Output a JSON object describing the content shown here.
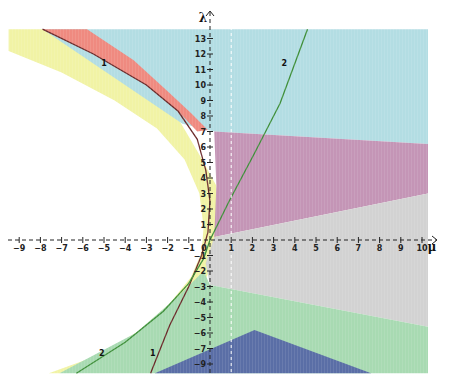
{
  "chart_data": {
    "type": "area",
    "title": "",
    "xlabel": "μ",
    "ylabel": "λ",
    "xlim": [
      -9.5,
      10.3
    ],
    "ylim": [
      -8.5,
      13.8
    ],
    "grid": false,
    "x_ticks": [
      -9,
      -8,
      -7,
      -6,
      -5,
      -4,
      -3,
      -2,
      -1,
      0,
      1,
      2,
      3,
      4,
      5,
      6,
      7,
      8,
      9,
      10
    ],
    "y_ticks": [
      -8,
      -7,
      -6,
      -5,
      -4,
      -3,
      -2,
      -1,
      1,
      2,
      3,
      4,
      5,
      6,
      7,
      8,
      9,
      10,
      11,
      12,
      13
    ],
    "y_tick_labels": [
      "-9",
      "-7",
      "-6",
      "-5",
      "-4",
      "-3",
      "-2",
      "-1",
      "1",
      "2",
      "3",
      "4",
      "5",
      "6",
      "7",
      "8",
      "9",
      "10",
      "11",
      "12",
      "13"
    ],
    "origin_label": "0",
    "dashed_reference_line": {
      "mu": 1
    },
    "regions": [
      {
        "name": "cyan",
        "color": "#b3dde3",
        "polygon": [
          [
            -7.9,
            13.6
          ],
          [
            10.3,
            13.6
          ],
          [
            10.3,
            6.2
          ],
          [
            0.2,
            7.0
          ],
          [
            -1.3,
            7.5
          ]
        ]
      },
      {
        "name": "purple",
        "color": "#c495b6",
        "polygon": [
          [
            0.2,
            7.0
          ],
          [
            10.3,
            6.2
          ],
          [
            10.3,
            3.0
          ],
          [
            0.2,
            0.2
          ],
          [
            0.3,
            3.5
          ]
        ]
      },
      {
        "name": "gray",
        "color": "#d2d2d2",
        "polygon": [
          [
            0.2,
            0.2
          ],
          [
            10.3,
            3.0
          ],
          [
            10.3,
            -5.6
          ],
          [
            0,
            -2.9
          ],
          [
            -0.2,
            -1.5
          ]
        ]
      },
      {
        "name": "green",
        "color": "#a8dab2",
        "polygon": [
          [
            0,
            -2.9
          ],
          [
            10.3,
            -5.6
          ],
          [
            10.3,
            -8.6
          ],
          [
            -7.1,
            -8.6
          ],
          [
            -3.5,
            -6.0
          ],
          [
            -1.4,
            -3.5
          ],
          [
            -0.3,
            -2.0
          ]
        ]
      },
      {
        "name": "blue",
        "color": "#5a6ea6",
        "polygon": [
          [
            -2.6,
            -8.6
          ],
          [
            2.1,
            -5.8
          ],
          [
            7.6,
            -8.6
          ]
        ]
      },
      {
        "name": "red",
        "color": "#ef8a80",
        "between": "curve-1 and outer boundary",
        "mu_range": [
          -7.9,
          -0.1
        ],
        "lambda_range": [
          7.0,
          13.6
        ]
      },
      {
        "name": "yellow",
        "color": "#f1f3a5",
        "between": "outer yellow boundary and white interior",
        "mu_range": [
          -9.5,
          0.6
        ],
        "lambda_range": [
          -8.6,
          13.6
        ]
      }
    ],
    "series": [
      {
        "name": "1",
        "color": "#6b2a2a",
        "points": [
          [
            -7.9,
            13.6
          ],
          [
            -5.5,
            12.0
          ],
          [
            -3.0,
            10.0
          ],
          [
            -1.5,
            8.3
          ],
          [
            -0.6,
            6.5
          ],
          [
            -0.2,
            4.5
          ],
          [
            0,
            2.5
          ],
          [
            -0.1,
            0.5
          ],
          [
            -0.4,
            -1.0
          ],
          [
            -1.0,
            -3.0
          ],
          [
            -1.9,
            -5.5
          ],
          [
            -2.8,
            -8.6
          ]
        ]
      },
      {
        "name": "2",
        "color": "#3f8f3a",
        "points": [
          [
            -6.3,
            -8.6
          ],
          [
            -4.0,
            -6.6
          ],
          [
            -2.2,
            -4.6
          ],
          [
            -1.0,
            -2.8
          ],
          [
            -0.3,
            -1.2
          ],
          [
            0,
            0
          ],
          [
            0.9,
            2.5
          ],
          [
            2.1,
            5.6
          ],
          [
            3.3,
            8.8
          ],
          [
            4.6,
            13.6
          ]
        ]
      }
    ],
    "annotations": [
      {
        "text": "1",
        "mu": -5.0,
        "lambda": 11.2
      },
      {
        "text": "2",
        "mu": 3.5,
        "lambda": 11.2
      },
      {
        "text": "2",
        "mu": -5.1,
        "lambda": -7.5
      },
      {
        "text": "1",
        "mu": -2.7,
        "lambda": -7.5
      }
    ]
  }
}
